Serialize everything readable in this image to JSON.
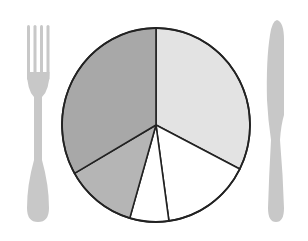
{
  "chart_data": {
    "type": "pie",
    "title": "",
    "style": "plate-with-cutlery",
    "start_angle_deg": 0,
    "direction": "clockwise",
    "slices": [
      {
        "label": "",
        "value": 32.5,
        "color": "#e3e3e3"
      },
      {
        "label": "",
        "value": 15.3,
        "color": "#ffffff"
      },
      {
        "label": "",
        "value": 6.7,
        "color": "#ffffff"
      },
      {
        "label": "",
        "value": 12.2,
        "color": "#b5b5b5"
      },
      {
        "label": "",
        "value": 33.3,
        "color": "#a8a8a8"
      }
    ],
    "values": [
      32.5,
      15.3,
      6.7,
      12.2,
      33.3
    ],
    "categories": [
      "",
      "",
      "",
      "",
      ""
    ],
    "legend": "none",
    "labels_shown": false
  },
  "decorations": {
    "fork": {
      "color": "#c8c8c8"
    },
    "knife": {
      "color": "#c8c8c8"
    },
    "outline_color": "#222222"
  }
}
